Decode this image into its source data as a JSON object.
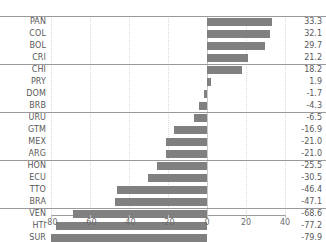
{
  "chart_data": {
    "type": "bar",
    "orientation": "horizontal",
    "title": "",
    "xlabel": "",
    "ylabel": "",
    "xlim": [
      -80,
      40
    ],
    "ylim": null,
    "grid": true,
    "grid_axis": "x",
    "legend": "none",
    "bar_color": "#808080",
    "categories": [
      "PAN",
      "COL",
      "BOL",
      "CRI",
      "CHI",
      "PRY",
      "DOM",
      "BRB",
      "URU",
      "GTM",
      "MEX",
      "ARG",
      "HON",
      "ECU",
      "TTO",
      "BRA",
      "VEN",
      "HTI",
      "SUR"
    ],
    "values": [
      33.3,
      32.1,
      29.7,
      21.2,
      18.2,
      1.9,
      -1.7,
      -4.3,
      -6.5,
      -16.9,
      -21.0,
      -21.0,
      -25.5,
      -30.5,
      -46.4,
      -47.1,
      -68.6,
      -77.2,
      -79.9
    ],
    "value_labels": [
      "33.3",
      "32.1",
      "29.7",
      "21.2",
      "18.2",
      "1.9",
      "-1.7",
      "-4.3",
      "-6.5",
      "-16.9",
      "-21.0",
      "-21.0",
      "-25.5",
      "-30.5",
      "-46.4",
      "-47.1",
      "-68.6",
      "-77.2",
      "-79.9"
    ],
    "xticks": [
      -80,
      -60,
      -40,
      -20,
      0,
      20,
      40
    ],
    "xtick_labels": [
      "-80",
      "-60",
      "-40",
      "-20",
      "0",
      "20",
      "40"
    ],
    "group_separators_after": [
      "CRI",
      "BRB",
      "ARG",
      "BRA"
    ]
  },
  "axis": {
    "zero_reference": "0"
  }
}
